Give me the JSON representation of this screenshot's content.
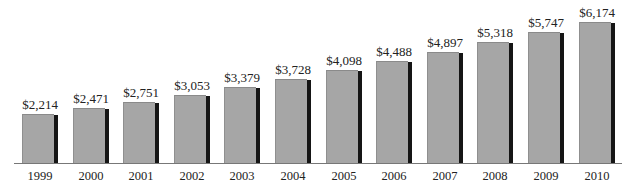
{
  "chart_data": {
    "type": "bar",
    "title": "",
    "xlabel": "",
    "ylabel": "",
    "categories": [
      "1999",
      "2000",
      "2001",
      "2002",
      "2003",
      "2004",
      "2005",
      "2006",
      "2007",
      "2008",
      "2009",
      "2010"
    ],
    "values": [
      2214,
      2471,
      2751,
      3053,
      3379,
      3728,
      4098,
      4488,
      4897,
      5318,
      5747,
      6174
    ],
    "data_labels": [
      "$2,214",
      "$2,471",
      "$2,751",
      "$3,053",
      "$3,379",
      "$3,728",
      "$4,098",
      "$4,488",
      "$4,897",
      "$5,318",
      "$5,747",
      "$6,174"
    ],
    "ylim": [
      0,
      6500
    ],
    "grid": false,
    "legend": null,
    "colors": {
      "bar": "#a6a6a6",
      "bar_shadow": "#151515",
      "axis": "#777777"
    }
  }
}
